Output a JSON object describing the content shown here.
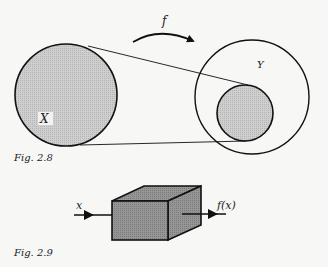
{
  "figure_2_8": {
    "caption": "Fig. 2.8",
    "map_label": "f",
    "domain_label": "X",
    "codomain_label": "Y"
  },
  "figure_2_9": {
    "caption": "Fig. 2.9",
    "input_label": "x",
    "output_label": "f(x)"
  },
  "colors": {
    "stroke": "#111111",
    "fill_gray": "#c4c4c4",
    "box_fill": "#8e8e8e",
    "background": "#f7f7f5"
  }
}
